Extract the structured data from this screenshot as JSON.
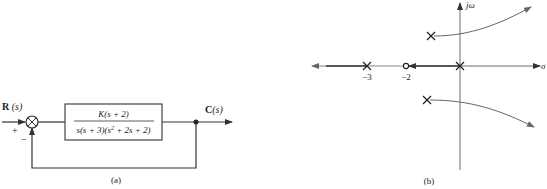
{
  "figure_a": {
    "caption": "(a)",
    "input_label_bold": "R",
    "input_label_var": " (s)",
    "output_label_bold": "C",
    "output_label_var": "(s)",
    "plus_sign": "+",
    "minus_sign": "−",
    "transfer_function": {
      "numerator": "K(s + 2)",
      "denominator_part1": "s(s + 3)(s",
      "denominator_exp": "2",
      "denominator_part2": " + 2s + 2)"
    }
  },
  "figure_b": {
    "caption": "(b)",
    "imag_axis_label": "jω",
    "real_axis_label": "σ",
    "tick_labels": [
      "−3",
      "−2"
    ],
    "poles": [
      "0",
      "−3",
      "−1 + j1",
      "−1 − j1"
    ],
    "zeros": [
      "−2"
    ],
    "colors": {
      "locus": "#555555",
      "axis": "#444444"
    }
  }
}
